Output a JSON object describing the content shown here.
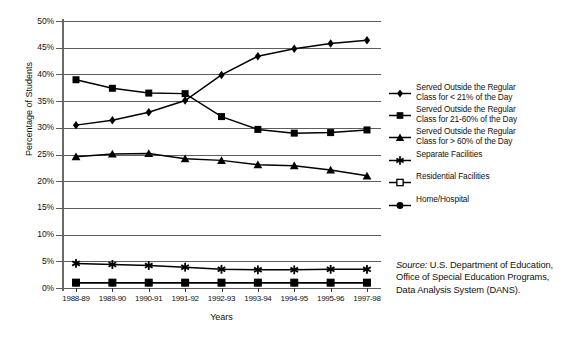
{
  "chart_data": {
    "type": "line",
    "title": "",
    "xlabel": "Years",
    "ylabel": "Percentage of Students",
    "ylim": [
      0,
      50
    ],
    "ytick_step": 5,
    "ytick_labels": [
      "0%",
      "5%",
      "10%",
      "15%",
      "20%",
      "25%",
      "30%",
      "35%",
      "40%",
      "45%",
      "50%"
    ],
    "grid": true,
    "legend_position": "right",
    "categories": [
      "1988-89",
      "1989-90",
      "1990-91",
      "1991-92",
      "1992-93",
      "1993-94",
      "1994-95",
      "1995-96",
      "1997-98"
    ],
    "series": [
      {
        "name": "Served Outside the Regular Class for < 21% of the Day",
        "marker": "diamond",
        "values": [
          30.5,
          31.4,
          32.9,
          35.1,
          39.9,
          43.4,
          44.8,
          45.8,
          46.4
        ]
      },
      {
        "name": "Served Outside the Regular Class for 21-60% of the Day",
        "marker": "square",
        "values": [
          39.0,
          37.4,
          36.5,
          36.4,
          32.1,
          29.7,
          29.0,
          29.1,
          29.6
        ]
      },
      {
        "name": "Served Outside the Regular Class for > 60% of the Day",
        "marker": "triangle",
        "values": [
          24.6,
          25.1,
          25.2,
          24.2,
          23.9,
          23.1,
          22.9,
          22.1,
          21.0
        ]
      },
      {
        "name": "Separate Facilities",
        "marker": "star",
        "values": [
          4.6,
          4.4,
          4.2,
          3.9,
          3.5,
          3.4,
          3.4,
          3.5,
          3.5
        ]
      },
      {
        "name": "Residential Facilities",
        "marker": "open-square",
        "values": [
          1.0,
          1.0,
          1.0,
          1.0,
          1.0,
          1.0,
          1.0,
          1.0,
          1.0
        ]
      },
      {
        "name": "Home/Hospital",
        "marker": "circle",
        "values": [
          1.0,
          1.0,
          1.0,
          1.0,
          1.0,
          1.0,
          1.0,
          1.0,
          1.0
        ]
      }
    ]
  },
  "legend": {
    "items": [
      {
        "marker": "diamond",
        "line1": "Served Outside the Regular",
        "line2": "Class for < 21% of the Day"
      },
      {
        "marker": "square",
        "line1": "Served Outside the Regular",
        "line2": "Class for 21-60% of the Day"
      },
      {
        "marker": "triangle",
        "line1": "Served Outside the Regular",
        "line2": "Class for > 60% of the Day"
      },
      {
        "marker": "star",
        "line1": "Separate Facilities",
        "line2": ""
      },
      {
        "marker": "open-square",
        "line1": "Residential Facilities",
        "line2": ""
      },
      {
        "marker": "circle",
        "line1": "Home/Hospital",
        "line2": ""
      }
    ]
  },
  "source_note": {
    "label": "Source:",
    "line1": " U.S. Department of Education,",
    "line2": "Office of Special Education Programs,",
    "line3": "Data Analysis System (DANS)."
  },
  "colors": {
    "ink": "#000000",
    "gridline": "#5d5d5d",
    "background": "#ffffff"
  }
}
